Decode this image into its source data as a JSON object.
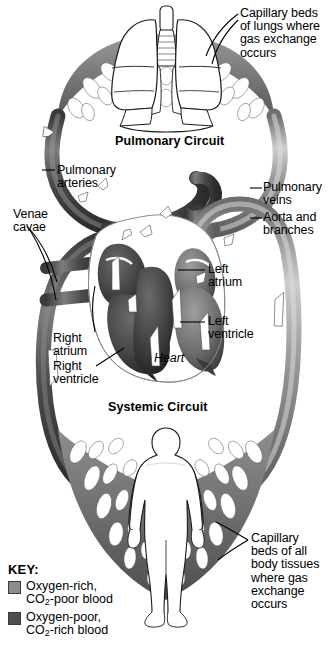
{
  "figure": {
    "kind": "anatomical-diagram",
    "palette": {
      "oxygen_rich": "#8c8c8c",
      "oxygen_poor": "#4f4f4f",
      "vessel_light": "#b4b4b4",
      "vessel_dark": "#3c3c3c",
      "outline": "#000000",
      "background": "#ffffff",
      "organ_fill": "#ffffff"
    }
  },
  "titles": {
    "pulmonary": "Pulmonary Circuit",
    "systemic": "Systemic Circuit",
    "heart": "Heart"
  },
  "callouts": {
    "capillary_lungs": "Capillary beds\nof lungs where\ngas exchange\noccurs",
    "pulmonary_arteries": "Pulmonary\narteries",
    "venae_cavae": "Venae\ncavae",
    "pulmonary_veins": "Pulmonary\nveins",
    "aorta": "Aorta and\nbranches",
    "left_atrium": "Left\natrium",
    "left_ventricle": "Left\nventricle",
    "right_atrium": "Right\natrium",
    "right_ventricle": "Right\nventricle",
    "capillary_body": "Capillary\nbeds of all\nbody tissues\nwhere gas\nexchange\noccurs"
  },
  "key": {
    "header": "KEY:",
    "entries": [
      {
        "swatch_color": "#8c8c8c",
        "line1": "Oxygen-rich,",
        "line2_pre": "CO",
        "line2_sub": "2",
        "line2_post": "-poor blood"
      },
      {
        "swatch_color": "#4f4f4f",
        "line1": "Oxygen-poor,",
        "line2_pre": "CO",
        "line2_sub": "2",
        "line2_post": "-rich blood"
      }
    ]
  },
  "organs": {
    "lungs": "lungs",
    "trachea": "trachea",
    "heart": "heart",
    "body": "human-body-silhouette"
  },
  "flow_arrows": {
    "count": 14,
    "color": "#ffffff",
    "meaning": "direction of blood flow"
  }
}
